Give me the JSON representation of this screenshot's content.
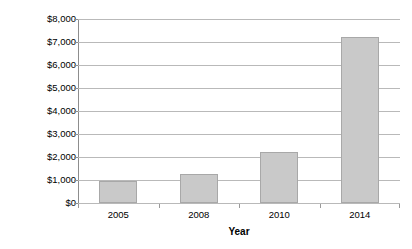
{
  "chart_data": {
    "type": "bar",
    "title": "",
    "subtitle": "",
    "xlabel": "Year",
    "ylabel": "$/kg TN",
    "categories": [
      "2005",
      "2008",
      "2010",
      "2014"
    ],
    "values": [
      950,
      1250,
      2200,
      7200
    ],
    "series": [
      {
        "name": "Cost per kg TN",
        "values": [
          950,
          1250,
          2200,
          7200
        ]
      }
    ],
    "ylim": [
      0,
      8000
    ],
    "ytick_step": 1000,
    "ytick_labels": [
      "$8,000",
      "$7,000",
      "$6,000",
      "$5,000",
      "$4,000",
      "$3,000",
      "$2,000",
      "$1,000",
      "$0"
    ],
    "ytick_values": [
      8000,
      7000,
      6000,
      5000,
      4000,
      3000,
      2000,
      1000,
      0
    ],
    "grid": "horizontal",
    "legend": "none",
    "bar_color": "#c9c9c9",
    "bar_border_color": "#a8a8a8",
    "gridline_color": "#b9b9b9",
    "axis_color": "#8d8d8d",
    "annotations": []
  }
}
